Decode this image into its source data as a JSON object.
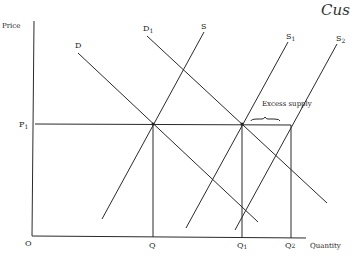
{
  "header": {
    "text": "Cus"
  },
  "axes": {
    "y_label": "Price",
    "x_label": "Quantity",
    "origin_label": "O"
  },
  "price_levels": [
    {
      "label": "P",
      "sub": "1"
    }
  ],
  "quantity_levels": [
    {
      "label": "Q",
      "sub": ""
    },
    {
      "label": "Q",
      "sub": "1"
    },
    {
      "label": "Q",
      "sub": "2"
    }
  ],
  "curves": {
    "D": {
      "label": "D",
      "sub": ""
    },
    "D1": {
      "label": "D",
      "sub": "1"
    },
    "S": {
      "label": "S",
      "sub": ""
    },
    "S1": {
      "label": "S",
      "sub": "1"
    },
    "S2": {
      "label": "S",
      "sub": "2"
    }
  },
  "annotation": {
    "text": "Excess supply"
  },
  "colors": {
    "line": "#2a2a2a",
    "background": "#ffffff"
  }
}
